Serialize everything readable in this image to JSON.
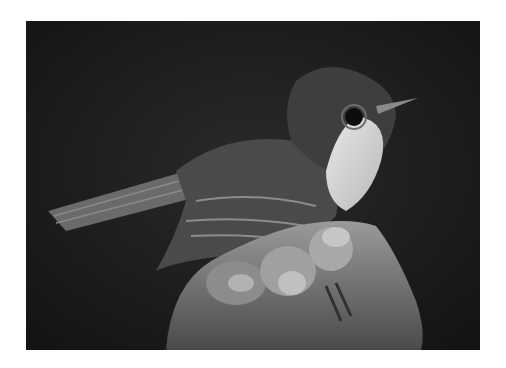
{
  "image": {
    "subject": "small bird perched on a human hand",
    "style": "black and white photograph",
    "alt": "Black and white photo of a small flycatcher-like bird with a pale throat held in a person's hand against a dark background"
  },
  "colors": {
    "border": "#ffffff",
    "background": "#1b1b1b"
  }
}
